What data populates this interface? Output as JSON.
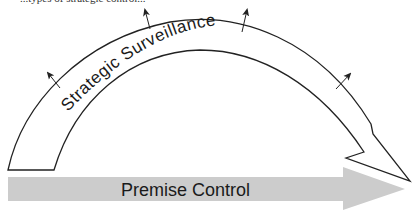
{
  "diagram": {
    "top_caption_partial": "...types of strategic control...",
    "arc": {
      "label": "Strategic Surveillance",
      "fill": "#ffffff",
      "stroke": "#222222",
      "outward_arrow_count": 4
    },
    "bar": {
      "label": "Premise Control",
      "fill": "#cccccc"
    }
  }
}
